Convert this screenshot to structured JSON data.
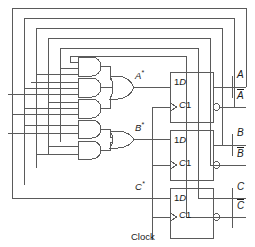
{
  "diagram": {
    "background": "#ffffff",
    "wire_color": "#5a5a5a",
    "gate_color": "#6a6a6a",
    "text_color": "#1a1a1a",
    "width": 255,
    "height": 247
  },
  "signals": {
    "a_next": "A",
    "a_next_star": "*",
    "b_next": "B",
    "b_next_star": "*",
    "c_next": "C",
    "c_next_star": "*"
  },
  "flipflops": [
    {
      "id": "ff-a",
      "data_label": "1D",
      "clock_label": "C1",
      "input_label": "A*",
      "q_output": "A",
      "qbar_output": "A",
      "qbar_overbar": true,
      "inverting_bubble": true
    },
    {
      "id": "ff-b",
      "data_label": "1D",
      "clock_label": "C1",
      "input_label": "B*",
      "q_output": "B",
      "qbar_output": "B",
      "qbar_overbar": true,
      "inverting_bubble": true
    },
    {
      "id": "ff-c",
      "data_label": "1D",
      "clock_label": "C1",
      "input_label": "C*",
      "q_output": "C",
      "qbar_output": "C",
      "qbar_overbar": true,
      "inverting_bubble": true
    }
  ],
  "outputs": [
    {
      "name": "A",
      "overbar": false
    },
    {
      "name": "A",
      "overbar": true
    },
    {
      "name": "B",
      "overbar": false
    },
    {
      "name": "B",
      "overbar": true
    },
    {
      "name": "C",
      "overbar": false
    },
    {
      "name": "C",
      "overbar": true
    }
  ],
  "clock": {
    "label": "Clock"
  },
  "gates": {
    "and_gates": [
      {
        "id": "and-a1",
        "inputs": 3,
        "feeds": "or-a"
      },
      {
        "id": "and-a2",
        "inputs": 3,
        "feeds": "or-a"
      },
      {
        "id": "and-a3",
        "inputs": 3,
        "feeds": "or-a"
      },
      {
        "id": "and-b1",
        "inputs": 2,
        "feeds": "or-b"
      },
      {
        "id": "and-b2",
        "inputs": 2,
        "feeds": "or-b"
      }
    ],
    "or_gates": [
      {
        "id": "or-a",
        "inputs": 3,
        "output": "A*"
      },
      {
        "id": "or-b",
        "inputs": 2,
        "output": "B*"
      }
    ]
  },
  "feedback_bus": {
    "description": "Nested feedback loops routing flip-flop outputs back to the gate network inputs",
    "loop_count": 6
  }
}
